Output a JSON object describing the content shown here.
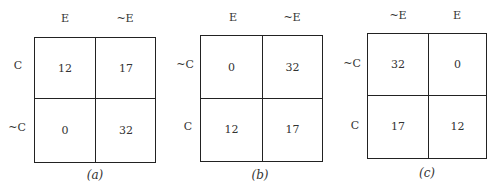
{
  "tables": [
    {
      "caption": "(a)",
      "col_headers": [
        "E",
        "~E"
      ],
      "row_headers": [
        "C",
        "~C"
      ],
      "cells": [
        [
          "12",
          "17"
        ],
        [
          "0",
          "32"
        ]
      ]
    },
    {
      "caption": "(b)",
      "col_headers": [
        "E",
        "~E"
      ],
      "row_headers": [
        "~C",
        "C"
      ],
      "cells": [
        [
          "0",
          "32"
        ],
        [
          "12",
          "17"
        ]
      ]
    },
    {
      "caption": "(c)",
      "col_headers": [
        "~E",
        "E"
      ],
      "row_headers": [
        "~C",
        "C"
      ],
      "cells": [
        [
          "32",
          "0"
        ],
        [
          "17",
          "12"
        ]
      ]
    }
  ]
}
